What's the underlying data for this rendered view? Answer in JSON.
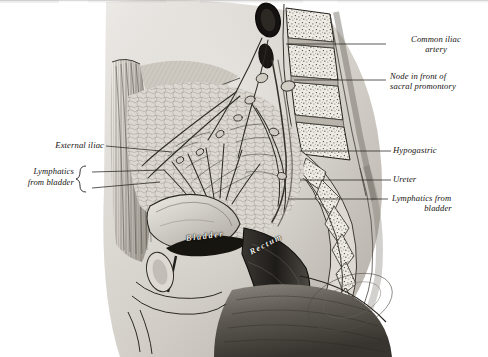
{
  "figure": {
    "domain": "anatomical-illustration",
    "medium": "engraving / halftone scan",
    "view": "midsagittal section of male pelvis",
    "palette": {
      "paper": "#ffffff",
      "ink": "#16130f",
      "mid_tone": "#b9b5ae",
      "deep_shadow": "#4a4640",
      "bone_fill": "#ece9e3",
      "reversed_text": "#f2f0ec"
    }
  },
  "labels": {
    "right": [
      {
        "id": "common-iliac-artery",
        "lines": [
          "Common iliac",
          "artery"
        ],
        "align": "center",
        "x": 388,
        "y": 36,
        "leader": {
          "x1": 370,
          "y1": 44,
          "x2": 386,
          "y2": 44
        }
      },
      {
        "id": "node-sacral-promontory",
        "lines": [
          "Node in front of",
          "sacral promontory"
        ],
        "align": "left",
        "x": 388,
        "y": 75,
        "leader": {
          "x1": 366,
          "y1": 80,
          "x2": 386,
          "y2": 80
        }
      },
      {
        "id": "hypogastric",
        "lines": [
          "Hypogastric"
        ],
        "align": "left",
        "x": 393,
        "y": 146,
        "leader": {
          "x1": 379,
          "y1": 151,
          "x2": 391,
          "y2": 151
        }
      },
      {
        "id": "ureter",
        "lines": [
          "Ureter"
        ],
        "align": "left",
        "x": 393,
        "y": 175,
        "leader": {
          "x1": 379,
          "y1": 180,
          "x2": 391,
          "y2": 180
        }
      },
      {
        "id": "lymphatics-from-bladder-right",
        "lines": [
          "Lymphatics from",
          "bladder"
        ],
        "align": "center",
        "x": 390,
        "y": 194,
        "leader": {
          "x1": 376,
          "y1": 199,
          "x2": 388,
          "y2": 199
        }
      }
    ],
    "left": [
      {
        "id": "external-iliac",
        "lines": [
          "External iliac"
        ],
        "align": "right",
        "x": 28,
        "y": 141,
        "leader": {
          "x1": 106,
          "y1": 146,
          "x2": 146,
          "y2": 150
        }
      },
      {
        "id": "lymphatics-from-bladder-left",
        "lines": [
          "Lymphatics",
          "from bladder"
        ],
        "align": "right",
        "x": 18,
        "y": 167,
        "brace": true,
        "leaders": [
          {
            "x1": 88,
            "y1": 172,
            "x2": 150,
            "y2": 169
          },
          {
            "x1": 88,
            "y1": 188,
            "x2": 150,
            "y2": 182
          }
        ]
      }
    ],
    "in_figure": [
      {
        "id": "bladder",
        "text": "Bladder",
        "x": 186,
        "y": 238,
        "rotate": -7
      },
      {
        "id": "rectum",
        "text": "Rectum",
        "x": 250,
        "y": 250,
        "rotate": -27
      }
    ]
  },
  "structures": [
    {
      "id": "lumbar-vertebral-bodies",
      "note": "stippled cancellous bone, stacked obliquely upper-centre-right"
    },
    {
      "id": "sacrum",
      "note": "curved chain of stippled segments arcing infero-posteriorly"
    },
    {
      "id": "aorta-lumen",
      "note": "dark oval at top of spinal column"
    },
    {
      "id": "rectus-abdominis",
      "note": "vertical striated muscle band, left margin"
    },
    {
      "id": "pelvic-lymphatic-plexus",
      "note": "fine reticulated vessel network centre of pelvis"
    },
    {
      "id": "bladder-body",
      "note": "pale rounded viscus, lower centre-left"
    },
    {
      "id": "rectum-body",
      "note": "dark tubular viscus, lower centre-right"
    },
    {
      "id": "perineum-buttock",
      "note": "deep graded shadow, lower right quadrant"
    }
  ]
}
